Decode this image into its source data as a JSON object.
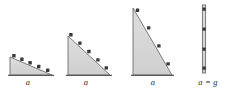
{
  "figure": {
    "type": "physics-diagram",
    "width": 225,
    "height": 94,
    "background_color": "#ffffff",
    "fill_color": "#d6d6d6",
    "edge_color": "#6e6e6e",
    "marker_color": "#3a3a3a",
    "label_color": "#2b2b2b"
  },
  "panels": [
    {
      "id": "panel-1",
      "label": "a",
      "label_x": 28,
      "label_y": 78,
      "incline_angle_deg": 16,
      "marker_count": 5,
      "triangle": {
        "x1": 10,
        "y1": 75,
        "x2": 52,
        "y2": 75,
        "x3": 10,
        "y3": 57
      },
      "markers": [
        {
          "x": 14,
          "y": 56
        },
        {
          "x": 22,
          "y": 59
        },
        {
          "x": 30,
          "y": 63
        },
        {
          "x": 39,
          "y": 66
        },
        {
          "x": 48,
          "y": 70
        }
      ]
    },
    {
      "id": "panel-2",
      "label": "a",
      "label_x": 86,
      "label_y": 78,
      "incline_angle_deg": 38,
      "marker_count": 5,
      "triangle": {
        "x1": 68,
        "y1": 75,
        "x2": 110,
        "y2": 75,
        "x3": 68,
        "y3": 36
      },
      "markers": [
        {
          "x": 71,
          "y": 35
        },
        {
          "x": 80,
          "y": 43
        },
        {
          "x": 89,
          "y": 52
        },
        {
          "x": 98,
          "y": 60
        },
        {
          "x": 106,
          "y": 68
        }
      ]
    },
    {
      "id": "panel-3",
      "label": "a",
      "label_x": 153,
      "label_y": 78,
      "incline_angle_deg": 62,
      "marker_count": 4,
      "triangle": {
        "x1": 133,
        "y1": 75,
        "x2": 172,
        "y2": 75,
        "x3": 133,
        "y3": 8
      },
      "markers": [
        {
          "x": 138,
          "y": 11
        },
        {
          "x": 149,
          "y": 28
        },
        {
          "x": 159,
          "y": 46
        },
        {
          "x": 168,
          "y": 64
        }
      ]
    },
    {
      "id": "panel-4",
      "label": "a = g",
      "label_x": 208,
      "label_y": 78,
      "incline_angle_deg": 90,
      "marker_count": 4,
      "line": {
        "x1": 204,
        "y1": 5,
        "x2": 204,
        "y2": 73
      },
      "markers": [
        {
          "x": 204,
          "y": 9
        },
        {
          "x": 204,
          "y": 29
        },
        {
          "x": 204,
          "y": 49
        },
        {
          "x": 204,
          "y": 68
        }
      ]
    }
  ]
}
